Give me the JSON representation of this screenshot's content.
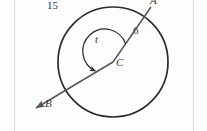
{
  "figure": {
    "background_color": "#fdfdfd",
    "stroke_color": "#2b2b2b",
    "ray_color": "#55555f",
    "arc_label_color": "#3a3a3a",
    "page_edge_color": "#d8d8d8"
  },
  "circle": {
    "center_x": 113,
    "center_y": 62,
    "radius": 55,
    "stroke_width": 1.6
  },
  "points": {
    "center": {
      "label": "C",
      "x": 113,
      "y": 62,
      "label_x": 115,
      "label_y": 58
    },
    "a": {
      "label": "A",
      "x": 151,
      "y": 7,
      "label_x": 150,
      "label_y": -4
    },
    "b": {
      "label": "B",
      "x": 57,
      "y": 95,
      "label_x": 44,
      "label_y": 98
    },
    "arrow_tip": {
      "x": 34,
      "y": 110
    }
  },
  "labels": {
    "arc_length": {
      "text": "15",
      "x": 47,
      "y": 0,
      "font_size": 11,
      "style": "upright"
    },
    "radius_length": {
      "text": "6",
      "x": 133,
      "y": 25,
      "font_size": 11,
      "style": "upright"
    },
    "angle": {
      "text": "t",
      "x": 95,
      "y": 34,
      "font_size": 11,
      "style": "italic"
    },
    "center_point": {
      "text": "C",
      "x": 116,
      "y": 57,
      "font_size": 11,
      "style": "italic"
    },
    "point_b": {
      "text": "B",
      "x": 45,
      "y": 98,
      "font_size": 11,
      "style": "italic"
    },
    "point_a": {
      "text": "A",
      "x": 150,
      "y": -5,
      "font_size": 11,
      "style": "italic"
    }
  },
  "angle_arc": {
    "radius": 22,
    "start_angle_deg": -55,
    "end_angle_deg": 180,
    "has_arrowhead": true
  },
  "page_edges": {
    "left_x": 14,
    "right_x": 193
  }
}
